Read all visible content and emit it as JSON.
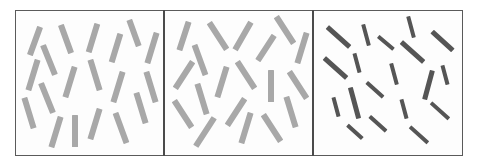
{
  "figure": {
    "frame": {
      "x": 15,
      "y": 10,
      "width": 448,
      "height": 146,
      "border_color": "#5a5a5a"
    },
    "dividers": [
      164,
      313
    ],
    "panels": [
      {
        "name": "panel-1",
        "x": 15,
        "width": 149,
        "bar_color": "#a8a8a8",
        "bars": [
          {
            "cx": 35,
            "cy": 41,
            "len": 30,
            "w": 6,
            "angle": 20
          },
          {
            "cx": 66,
            "cy": 39,
            "len": 30,
            "w": 6,
            "angle": -20
          },
          {
            "cx": 93,
            "cy": 38,
            "len": 30,
            "w": 6,
            "angle": 17
          },
          {
            "cx": 116,
            "cy": 48,
            "len": 30,
            "w": 6,
            "angle": 17
          },
          {
            "cx": 134,
            "cy": 33,
            "len": 28,
            "w": 6,
            "angle": -20
          },
          {
            "cx": 152,
            "cy": 48,
            "len": 32,
            "w": 6,
            "angle": 17
          },
          {
            "cx": 49,
            "cy": 60,
            "len": 32,
            "w": 6,
            "angle": -22
          },
          {
            "cx": 33,
            "cy": 75,
            "len": 32,
            "w": 6,
            "angle": 17
          },
          {
            "cx": 70,
            "cy": 82,
            "len": 32,
            "w": 6,
            "angle": 17
          },
          {
            "cx": 95,
            "cy": 75,
            "len": 32,
            "w": 6,
            "angle": -17
          },
          {
            "cx": 118,
            "cy": 87,
            "len": 32,
            "w": 6,
            "angle": 17
          },
          {
            "cx": 151,
            "cy": 87,
            "len": 32,
            "w": 6,
            "angle": -17
          },
          {
            "cx": 47,
            "cy": 98,
            "len": 32,
            "w": 6,
            "angle": -22
          },
          {
            "cx": 29,
            "cy": 113,
            "len": 32,
            "w": 6,
            "angle": -17
          },
          {
            "cx": 56,
            "cy": 132,
            "len": 32,
            "w": 6,
            "angle": 17
          },
          {
            "cx": 75,
            "cy": 131,
            "len": 32,
            "w": 6,
            "angle": 0
          },
          {
            "cx": 95,
            "cy": 124,
            "len": 32,
            "w": 6,
            "angle": 17
          },
          {
            "cx": 121,
            "cy": 128,
            "len": 32,
            "w": 6,
            "angle": -20
          },
          {
            "cx": 141,
            "cy": 108,
            "len": 32,
            "w": 6,
            "angle": -17
          }
        ]
      },
      {
        "name": "panel-2",
        "x": 164,
        "width": 149,
        "bar_color": "#a8a8a8",
        "bars": [
          {
            "cx": 184,
            "cy": 36,
            "len": 30,
            "w": 6,
            "angle": 18
          },
          {
            "cx": 218,
            "cy": 36,
            "len": 32,
            "w": 6,
            "angle": -33
          },
          {
            "cx": 243,
            "cy": 36,
            "len": 32,
            "w": 6,
            "angle": 30
          },
          {
            "cx": 266,
            "cy": 48,
            "len": 30,
            "w": 6,
            "angle": 33
          },
          {
            "cx": 285,
            "cy": 30,
            "len": 32,
            "w": 6,
            "angle": -33
          },
          {
            "cx": 302,
            "cy": 48,
            "len": 32,
            "w": 6,
            "angle": 17
          },
          {
            "cx": 200,
            "cy": 60,
            "len": 32,
            "w": 6,
            "angle": -20
          },
          {
            "cx": 184,
            "cy": 75,
            "len": 32,
            "w": 6,
            "angle": 33
          },
          {
            "cx": 222,
            "cy": 82,
            "len": 32,
            "w": 6,
            "angle": 17
          },
          {
            "cx": 246,
            "cy": 75,
            "len": 32,
            "w": 6,
            "angle": -33
          },
          {
            "cx": 271,
            "cy": 86,
            "len": 32,
            "w": 6,
            "angle": 0
          },
          {
            "cx": 298,
            "cy": 85,
            "len": 32,
            "w": 6,
            "angle": -33
          },
          {
            "cx": 202,
            "cy": 99,
            "len": 32,
            "w": 6,
            "angle": -17
          },
          {
            "cx": 183,
            "cy": 114,
            "len": 32,
            "w": 6,
            "angle": -33
          },
          {
            "cx": 205,
            "cy": 132,
            "len": 34,
            "w": 6,
            "angle": 33
          },
          {
            "cx": 236,
            "cy": 112,
            "len": 32,
            "w": 6,
            "angle": 33
          },
          {
            "cx": 246,
            "cy": 128,
            "len": 32,
            "w": 6,
            "angle": 17
          },
          {
            "cx": 272,
            "cy": 128,
            "len": 32,
            "w": 6,
            "angle": -33
          },
          {
            "cx": 291,
            "cy": 112,
            "len": 32,
            "w": 6,
            "angle": -17
          }
        ]
      },
      {
        "name": "panel-3",
        "x": 313,
        "width": 150,
        "bar_color": "#555555",
        "bars": [
          {
            "cx": 338,
            "cy": 37,
            "len": 30,
            "w": 5,
            "angle": -48
          },
          {
            "cx": 366,
            "cy": 35,
            "len": 22,
            "w": 3.5,
            "angle": -15
          },
          {
            "cx": 386,
            "cy": 43,
            "len": 20,
            "w": 3.5,
            "angle": -50
          },
          {
            "cx": 411,
            "cy": 27,
            "len": 22,
            "w": 3.5,
            "angle": -15
          },
          {
            "cx": 412,
            "cy": 52,
            "len": 30,
            "w": 5,
            "angle": -48
          },
          {
            "cx": 442,
            "cy": 41,
            "len": 28,
            "w": 5,
            "angle": -48
          },
          {
            "cx": 335,
            "cy": 68,
            "len": 30,
            "w": 5,
            "angle": -48
          },
          {
            "cx": 357,
            "cy": 63,
            "len": 20,
            "w": 3.5,
            "angle": -15
          },
          {
            "cx": 394,
            "cy": 74,
            "len": 22,
            "w": 3.5,
            "angle": -15
          },
          {
            "cx": 428,
            "cy": 85,
            "len": 30,
            "w": 5,
            "angle": 15
          },
          {
            "cx": 445,
            "cy": 75,
            "len": 20,
            "w": 3.5,
            "angle": -15
          },
          {
            "cx": 375,
            "cy": 90,
            "len": 22,
            "w": 3.5,
            "angle": -48
          },
          {
            "cx": 354,
            "cy": 103,
            "len": 32,
            "w": 5,
            "angle": -15
          },
          {
            "cx": 336,
            "cy": 107,
            "len": 20,
            "w": 3.5,
            "angle": -15
          },
          {
            "cx": 404,
            "cy": 109,
            "len": 20,
            "w": 3.5,
            "angle": -15
          },
          {
            "cx": 440,
            "cy": 111,
            "len": 24,
            "w": 3.5,
            "angle": -48
          },
          {
            "cx": 378,
            "cy": 124,
            "len": 22,
            "w": 3.5,
            "angle": -48
          },
          {
            "cx": 355,
            "cy": 132,
            "len": 20,
            "w": 3.5,
            "angle": -48
          },
          {
            "cx": 419,
            "cy": 135,
            "len": 24,
            "w": 3.5,
            "angle": -48
          }
        ]
      }
    ]
  }
}
